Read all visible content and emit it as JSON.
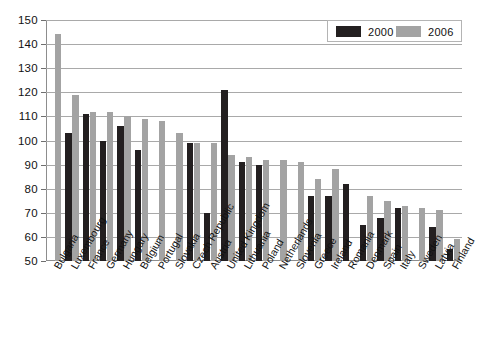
{
  "chart_data": {
    "type": "bar",
    "title": "",
    "subtitle": "",
    "xlabel": "",
    "ylabel": "",
    "ylim": [
      50,
      150
    ],
    "ytick_step": 10,
    "yticks": [
      50,
      60,
      70,
      80,
      90,
      100,
      110,
      120,
      130,
      140,
      150
    ],
    "grid": true,
    "legend_position": "top-right",
    "categories": [
      "Bulgaria",
      "Luxembourg",
      "France",
      "Germany",
      "Hungary",
      "Belgium",
      "Portugal",
      "Slovakia",
      "Czech Republic",
      "Austria",
      "United Kingdom",
      "Lithuania",
      "Poland",
      "Netherlands",
      "Slovenia",
      "Greece",
      "Ireland",
      "Romania",
      "Denmark",
      "Spain",
      "Italy",
      "Sweden",
      "Latvia",
      "Finland"
    ],
    "series": [
      {
        "name": "2000",
        "color": "#231f20",
        "values": [
          null,
          103,
          111,
          100,
          106,
          96,
          null,
          null,
          99,
          70,
          121,
          91,
          90,
          null,
          null,
          77,
          77,
          82,
          65,
          68,
          72,
          null,
          64,
          55
        ]
      },
      {
        "name": "2006",
        "color": "#a3a3a3",
        "values": [
          144,
          119,
          112,
          112,
          110,
          109,
          108,
          103,
          99,
          99,
          94,
          93,
          92,
          92,
          91,
          84,
          88,
          null,
          77,
          75,
          73,
          72,
          71,
          59
        ]
      }
    ]
  },
  "legend": {
    "items": [
      {
        "label": "2000",
        "color": "#231f20"
      },
      {
        "label": "2006",
        "color": "#a3a3a3"
      }
    ]
  }
}
